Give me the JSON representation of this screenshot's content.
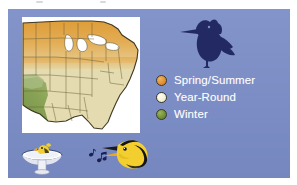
{
  "panel": {
    "background_color": "#7d8fc6"
  },
  "legend": {
    "title": "",
    "items": [
      {
        "label": "Spring/Summer",
        "color": "#e08a2e"
      },
      {
        "label": "Year-Round",
        "color": "#f2eed2"
      },
      {
        "label": "Winter",
        "color": "#6d8b35"
      }
    ]
  },
  "map": {
    "name": "united-states-range-map",
    "region": "Eastern and central United States",
    "background_color": "#ffffff",
    "colors": {
      "spring_summer": "#e0a03c",
      "year_round": "#e4dcb0",
      "winter": "#7d9a4e",
      "lakes": "#ffffff",
      "border": "#4a4228"
    }
  },
  "illustrations": {
    "silhouette": {
      "name": "perched-bird-silhouette",
      "color": "#232a63"
    },
    "bird_bath": {
      "name": "bird-bath-with-bird",
      "bowl_color": "#f3f3f3",
      "bird_color": "#f2cf2f"
    },
    "singing_bird": {
      "name": "singing-goldfinch-head",
      "body_color": "#f2cf2f",
      "marking_color": "#141414"
    },
    "music_notes": {
      "name": "music-notes",
      "color": "#1b2150"
    }
  },
  "crop_artifact": {
    "present": true,
    "description": "faint partial text row cropped from the page above"
  }
}
